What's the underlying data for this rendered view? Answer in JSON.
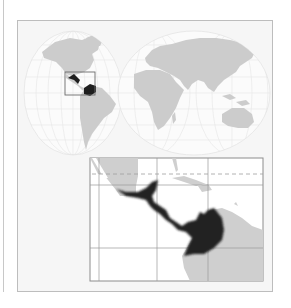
{
  "figure": {
    "type": "locator-map",
    "world_map": {
      "projection": "interrupted-oval (two hemispheres)",
      "land_color": "#c9c9c9",
      "ocean_color": "#f6f6f6",
      "graticule_color": "#e2e2e2",
      "highlight_color": "#1e1e1e",
      "locator_box": "Central America and northwestern South America"
    },
    "inset_map": {
      "region": "Central America, Caribbean and northwestern South America",
      "land_color": "#cfcfcf",
      "water_color": "#ffffff",
      "highlight_color": "#222222",
      "grid_color": "#9a9a9a",
      "dashed_line": "Tropic of Cancer"
    },
    "panel_background": "#f6f6f6",
    "border_color": "#bdbdbd"
  }
}
